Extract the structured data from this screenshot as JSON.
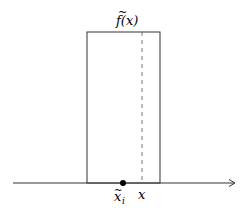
{
  "diagram": {
    "function_label": "f(x)",
    "function_tilde": "~",
    "point_label_base": "x",
    "point_label_sub": "i",
    "point_label_tilde": "~",
    "x_label": "x",
    "colors": {
      "stroke": "#333333",
      "dashed": "#555555",
      "dot": "#000000"
    }
  }
}
